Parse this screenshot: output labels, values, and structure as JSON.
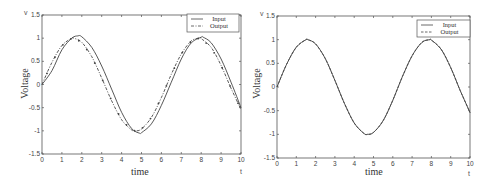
{
  "chart_data": [
    {
      "type": "line",
      "title": "",
      "xlabel": "time",
      "ylabel": "Voltage",
      "x_corner_label": "t",
      "y_corner_label": "v",
      "xlim": [
        0,
        10
      ],
      "ylim": [
        -1.5,
        1.5
      ],
      "xticks": [
        "0",
        "1",
        "2",
        "3",
        "4",
        "5",
        "6",
        "7",
        "8",
        "9",
        "10"
      ],
      "yticks": [
        "1.5",
        "1",
        "0.5",
        "0",
        "-0.5",
        "-1",
        "-1.5"
      ],
      "grid": false,
      "legend_position": "upper right",
      "series": [
        {
          "name": "Input",
          "style": "solid",
          "x": [
            0,
            0.5,
            1,
            1.5,
            1.8,
            2,
            2.5,
            3,
            3.5,
            4,
            4.5,
            4.9,
            5,
            5.5,
            6,
            6.5,
            7,
            7.5,
            8,
            8.1,
            8.5,
            9,
            9.5,
            10
          ],
          "y": [
            0,
            0.3,
            0.75,
            1.0,
            1.05,
            1.03,
            0.8,
            0.4,
            -0.1,
            -0.6,
            -0.95,
            -1.05,
            -1.04,
            -0.85,
            -0.45,
            0.05,
            0.55,
            0.9,
            1.02,
            1.02,
            0.9,
            0.55,
            0.05,
            -0.5
          ]
        },
        {
          "name": "Output",
          "style": "dash-dot with markers",
          "x": [
            0,
            0.5,
            1,
            1.5,
            1.6,
            2,
            2.5,
            3,
            3.5,
            4,
            4.5,
            4.7,
            5,
            5.5,
            6,
            6.5,
            7,
            7.5,
            7.9,
            8,
            8.5,
            9,
            9.5,
            10
          ],
          "y": [
            0,
            0.48,
            0.84,
            1.0,
            1.0,
            0.91,
            0.6,
            0.14,
            -0.35,
            -0.76,
            -0.98,
            -1.0,
            -0.96,
            -0.71,
            -0.28,
            0.22,
            0.66,
            0.94,
            1.0,
            0.99,
            0.8,
            0.41,
            -0.08,
            -0.54
          ]
        }
      ]
    },
    {
      "type": "line",
      "title": "",
      "xlabel": "time",
      "ylabel": "Voltage",
      "x_corner_label": "t",
      "y_corner_label": "v",
      "xlim": [
        0,
        10
      ],
      "ylim": [
        -1.5,
        1.5
      ],
      "xticks": [
        "0",
        "1",
        "2",
        "3",
        "4",
        "5",
        "6",
        "7",
        "8",
        "9",
        "10"
      ],
      "yticks": [
        "1.5",
        "1",
        "0.5",
        "0",
        "-0.5",
        "-1",
        "-1.5"
      ],
      "grid": false,
      "legend_position": "upper right",
      "series": [
        {
          "name": "Input",
          "style": "solid",
          "x": [
            0,
            0.5,
            1,
            1.5,
            1.6,
            2,
            2.5,
            3,
            3.5,
            4,
            4.5,
            4.7,
            5,
            5.5,
            6,
            6.5,
            7,
            7.5,
            7.9,
            8,
            8.5,
            9,
            9.5,
            10
          ],
          "y": [
            0,
            0.48,
            0.84,
            1.0,
            1.0,
            0.91,
            0.6,
            0.14,
            -0.35,
            -0.76,
            -0.98,
            -1.0,
            -0.96,
            -0.71,
            -0.28,
            0.22,
            0.66,
            0.94,
            1.0,
            0.99,
            0.8,
            0.41,
            -0.08,
            -0.54
          ]
        },
        {
          "name": "Output",
          "style": "dashed",
          "x": [
            0,
            0.5,
            1,
            1.5,
            1.6,
            2,
            2.5,
            3,
            3.5,
            4,
            4.5,
            4.7,
            5,
            5.5,
            6,
            6.5,
            7,
            7.5,
            7.9,
            8,
            8.5,
            9,
            9.5,
            10
          ],
          "y": [
            0,
            0.48,
            0.84,
            1.0,
            1.0,
            0.91,
            0.6,
            0.14,
            -0.35,
            -0.76,
            -0.98,
            -1.0,
            -0.96,
            -0.71,
            -0.28,
            0.22,
            0.66,
            0.94,
            1.0,
            0.99,
            0.8,
            0.41,
            -0.08,
            -0.54
          ]
        }
      ]
    }
  ],
  "left": {
    "ylabel": "Voltage",
    "xlabel": "time",
    "x_corner": "t",
    "y_corner": "v",
    "legend": [
      "Input",
      "Output"
    ]
  },
  "right": {
    "ylabel": "Voltage",
    "xlabel": "time",
    "x_corner": "t",
    "y_corner": "v",
    "legend": [
      "Input",
      "Output"
    ]
  }
}
